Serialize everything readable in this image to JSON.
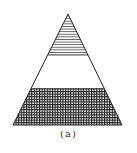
{
  "figure": {
    "caption": "(a)",
    "shape": "triangle",
    "regions": [
      {
        "name": "top",
        "fill": "horizontal-lines"
      },
      {
        "name": "middle",
        "fill": "empty"
      },
      {
        "name": "bottom",
        "fill": "cross-hatch-grid"
      }
    ],
    "colors": {
      "stroke": "#222222",
      "background": "#ffffff"
    }
  }
}
